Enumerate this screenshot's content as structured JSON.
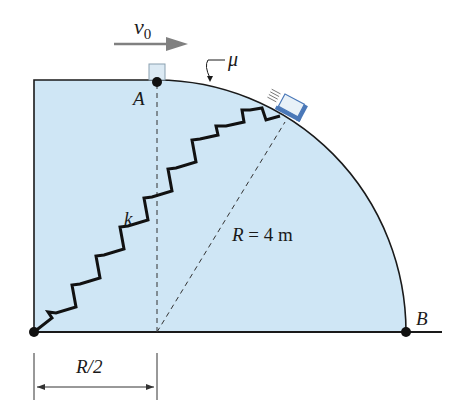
{
  "figure": {
    "labels": {
      "velocity": "v",
      "velocity_sub": "0",
      "friction": "μ",
      "point_a": "A",
      "point_b": "B",
      "spring_constant": "k",
      "radius_var": "R",
      "radius_eq": " = 4 m",
      "dimension": "R/2"
    },
    "colors": {
      "fill": "#cfe6f5",
      "stroke": "#1a1a1a",
      "arrow": "#808080",
      "slider": "#4a78b8",
      "block": "#dceaf4"
    },
    "values": {
      "radius_m": 4,
      "offset": "R/2"
    }
  }
}
